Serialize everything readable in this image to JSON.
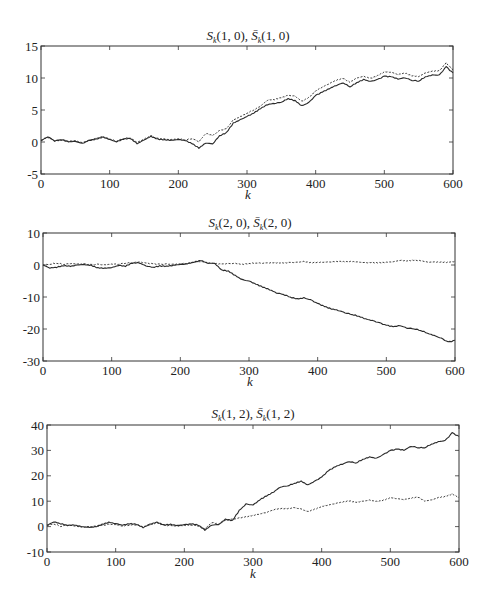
{
  "figure": {
    "panel_count": 3
  },
  "chart_data": [
    {
      "type": "line",
      "title": "S_k(1,0), S̄_k(1,0)",
      "title_parts": {
        "s1": "S",
        "sub1": "k",
        "args1": "(1, 0), ",
        "s2": "S̄",
        "sub2": "k",
        "args2": "(1, 0)"
      },
      "xlabel": "k",
      "ylabel": "",
      "xlim": [
        0,
        600
      ],
      "ylim": [
        -5,
        15
      ],
      "xticks": [
        0,
        100,
        200,
        300,
        400,
        500,
        600
      ],
      "yticks": [
        -5,
        0,
        5,
        10,
        15
      ],
      "grid": false,
      "legend": null,
      "x": [
        0,
        10,
        20,
        30,
        40,
        50,
        60,
        70,
        80,
        90,
        100,
        110,
        120,
        130,
        140,
        150,
        160,
        170,
        180,
        190,
        200,
        210,
        220,
        230,
        240,
        250,
        260,
        270,
        280,
        290,
        300,
        310,
        320,
        330,
        340,
        350,
        360,
        370,
        380,
        390,
        400,
        410,
        420,
        430,
        440,
        450,
        460,
        470,
        480,
        490,
        500,
        510,
        520,
        530,
        540,
        550,
        560,
        570,
        580,
        590,
        600
      ],
      "series": [
        {
          "name": "S_k(1,0)",
          "style": "solid",
          "values": [
            0.2,
            0.8,
            0.1,
            0.3,
            0.0,
            0.1,
            -0.2,
            0.3,
            0.5,
            0.8,
            0.4,
            0.0,
            0.4,
            0.5,
            -0.3,
            0.3,
            0.9,
            0.5,
            0.4,
            0.3,
            0.4,
            0.2,
            -0.3,
            -1.0,
            -0.2,
            -0.3,
            1.0,
            1.5,
            3.0,
            3.5,
            4.0,
            4.5,
            5.2,
            5.8,
            6.0,
            6.2,
            6.8,
            6.5,
            5.7,
            6.2,
            7.3,
            7.8,
            8.3,
            8.8,
            9.2,
            8.6,
            9.3,
            9.8,
            9.5,
            9.8,
            10.3,
            10.2,
            9.8,
            10.0,
            9.6,
            9.5,
            10.2,
            10.5,
            10.5,
            11.8,
            10.8
          ]
        },
        {
          "name": "S̄_k(1,0)",
          "style": "dashed",
          "values": [
            0.3,
            0.7,
            0.2,
            0.3,
            0.1,
            0.2,
            -0.1,
            0.3,
            0.6,
            0.9,
            0.5,
            0.1,
            0.5,
            0.6,
            -0.1,
            0.4,
            1.0,
            0.6,
            0.5,
            0.4,
            0.5,
            0.3,
            0.5,
            0.0,
            1.3,
            1.0,
            1.8,
            2.1,
            3.5,
            4.0,
            4.5,
            5.0,
            5.6,
            6.5,
            6.6,
            6.9,
            7.3,
            7.2,
            6.4,
            7.0,
            8.0,
            8.6,
            9.1,
            9.6,
            9.9,
            9.3,
            10.0,
            10.3,
            10.0,
            10.4,
            11.0,
            10.9,
            10.5,
            10.7,
            10.3,
            10.2,
            10.8,
            11.1,
            11.2,
            12.4,
            11.3
          ]
        }
      ]
    },
    {
      "type": "line",
      "title": "S_k(2,0), S̄_k(2,0)",
      "title_parts": {
        "s1": "S",
        "sub1": "k",
        "args1": "(2, 0), ",
        "s2": "S̄",
        "sub2": "k",
        "args2": "(2, 0)"
      },
      "xlabel": "k",
      "ylabel": "",
      "xlim": [
        0,
        600
      ],
      "ylim": [
        -30,
        10
      ],
      "xticks": [
        0,
        100,
        200,
        300,
        400,
        500,
        600
      ],
      "yticks": [
        -30,
        -20,
        -10,
        0,
        10
      ],
      "grid": false,
      "legend": null,
      "x": [
        0,
        10,
        20,
        30,
        40,
        50,
        60,
        70,
        80,
        90,
        100,
        110,
        120,
        130,
        140,
        150,
        160,
        170,
        180,
        190,
        200,
        210,
        220,
        230,
        240,
        250,
        260,
        270,
        280,
        290,
        300,
        310,
        320,
        330,
        340,
        350,
        360,
        370,
        380,
        390,
        400,
        410,
        420,
        430,
        440,
        450,
        460,
        470,
        480,
        490,
        500,
        510,
        520,
        530,
        540,
        550,
        560,
        570,
        580,
        590,
        600
      ],
      "series": [
        {
          "name": "S_k(2,0)",
          "style": "solid",
          "values": [
            0.0,
            -1.0,
            -0.8,
            -0.3,
            -0.5,
            0.0,
            0.2,
            0.0,
            -0.8,
            -0.9,
            -0.8,
            -0.2,
            -0.5,
            0.5,
            0.6,
            -0.3,
            -0.7,
            -0.2,
            -0.3,
            0.0,
            0.2,
            0.3,
            0.8,
            1.3,
            0.5,
            0.5,
            -1.5,
            -1.8,
            -3.2,
            -4.5,
            -5.0,
            -6.0,
            -7.0,
            -7.8,
            -8.8,
            -9.2,
            -10.0,
            -10.5,
            -10.2,
            -10.8,
            -12.0,
            -13.0,
            -13.8,
            -14.3,
            -15.0,
            -15.5,
            -16.0,
            -16.8,
            -17.3,
            -18.0,
            -18.8,
            -19.3,
            -19.0,
            -19.8,
            -20.0,
            -20.5,
            -21.3,
            -22.0,
            -22.8,
            -24.0,
            -23.5
          ]
        },
        {
          "name": "S̄_k(2,0)",
          "style": "dashed",
          "values": [
            0.0,
            0.2,
            0.5,
            0.1,
            0.4,
            0.3,
            0.4,
            0.2,
            0.3,
            0.1,
            0.3,
            0.2,
            0.5,
            0.6,
            0.9,
            0.6,
            0.4,
            0.3,
            0.4,
            0.3,
            0.4,
            0.5,
            0.8,
            1.0,
            0.5,
            0.4,
            0.3,
            0.5,
            0.6,
            0.3,
            0.5,
            0.6,
            0.5,
            0.6,
            0.6,
            0.6,
            0.8,
            0.9,
            1.2,
            0.8,
            0.9,
            0.9,
            0.9,
            1.0,
            0.9,
            1.0,
            0.9,
            0.8,
            0.9,
            0.8,
            0.9,
            1.0,
            1.4,
            1.2,
            1.4,
            1.3,
            0.9,
            1.0,
            1.0,
            1.0,
            1.2
          ]
        }
      ]
    },
    {
      "type": "line",
      "title": "S_k(1,2), S̄_k(1,2)",
      "title_parts": {
        "s1": "S",
        "sub1": "k",
        "args1": "(1, 2), ",
        "s2": "S̄",
        "sub2": "k",
        "args2": "(1, 2)"
      },
      "xlabel": "k",
      "ylabel": "",
      "xlim": [
        0,
        600
      ],
      "ylim": [
        -10,
        40
      ],
      "xticks": [
        0,
        100,
        200,
        300,
        400,
        500,
        600
      ],
      "yticks": [
        -10,
        0,
        10,
        20,
        30,
        40
      ],
      "grid": false,
      "legend": null,
      "x": [
        0,
        10,
        20,
        30,
        40,
        50,
        60,
        70,
        80,
        90,
        100,
        110,
        120,
        130,
        140,
        150,
        160,
        170,
        180,
        190,
        200,
        210,
        220,
        230,
        240,
        250,
        260,
        270,
        280,
        290,
        300,
        310,
        320,
        330,
        340,
        350,
        360,
        370,
        380,
        390,
        400,
        410,
        420,
        430,
        440,
        450,
        460,
        470,
        480,
        490,
        500,
        510,
        520,
        530,
        540,
        550,
        560,
        570,
        580,
        590,
        600
      ],
      "series": [
        {
          "name": "S_k(1,2)",
          "style": "solid",
          "values": [
            0.5,
            1.8,
            1.0,
            0.3,
            0.5,
            0.0,
            -0.2,
            0.0,
            1.0,
            1.8,
            1.2,
            0.5,
            1.0,
            0.8,
            -0.5,
            1.0,
            1.8,
            0.8,
            1.0,
            0.5,
            0.8,
            1.0,
            0.5,
            -1.5,
            0.5,
            0.8,
            3.0,
            2.5,
            6.5,
            9.0,
            8.5,
            10.5,
            12.0,
            13.5,
            15.5,
            16.0,
            17.0,
            18.0,
            16.5,
            18.0,
            19.5,
            22.0,
            23.5,
            24.5,
            25.5,
            25.0,
            26.5,
            27.5,
            27.0,
            28.5,
            30.0,
            30.5,
            30.0,
            31.5,
            31.0,
            31.0,
            32.5,
            33.5,
            34.0,
            37.0,
            35.5
          ]
        },
        {
          "name": "S̄_k(1,2)",
          "style": "dashed",
          "values": [
            0.5,
            1.0,
            0.0,
            0.5,
            0.2,
            -0.2,
            0.0,
            0.2,
            0.5,
            1.0,
            0.8,
            0.2,
            0.5,
            0.6,
            -0.2,
            0.5,
            1.5,
            0.6,
            0.5,
            0.3,
            0.5,
            0.5,
            0.2,
            -1.0,
            1.5,
            1.0,
            2.5,
            3.0,
            3.5,
            4.0,
            4.5,
            5.0,
            5.5,
            6.5,
            7.0,
            7.0,
            7.5,
            7.0,
            6.0,
            7.0,
            8.0,
            8.5,
            9.0,
            9.5,
            10.0,
            9.5,
            10.0,
            10.5,
            10.0,
            10.5,
            11.5,
            11.0,
            10.5,
            11.0,
            11.5,
            10.0,
            10.5,
            11.5,
            12.0,
            13.0,
            11.5
          ]
        }
      ]
    }
  ],
  "panels": [
    {
      "id": "panel-1",
      "title": {
        "s1": "S",
        "sub1": "k",
        "args1": "(1, 0), ",
        "s2": "S̄",
        "sub2": "k",
        "args2": "(1, 0)"
      },
      "xlabel": "k",
      "xtick_labels": [
        "0",
        "100",
        "200",
        "300",
        "400",
        "500",
        "600"
      ],
      "ytick_labels": [
        "15",
        "10",
        "5",
        "0",
        "-5"
      ]
    },
    {
      "id": "panel-2",
      "title": {
        "s1": "S",
        "sub1": "k",
        "args1": "(2, 0), ",
        "s2": "S̄",
        "sub2": "k",
        "args2": "(2, 0)"
      },
      "xlabel": "k",
      "xtick_labels": [
        "0",
        "100",
        "200",
        "300",
        "400",
        "500",
        "600"
      ],
      "ytick_labels": [
        "10",
        "0",
        "-10",
        "-20",
        "-30"
      ]
    },
    {
      "id": "panel-3",
      "title": {
        "s1": "S",
        "sub1": "k",
        "args1": "(1, 2), ",
        "s2": "S̄",
        "sub2": "k",
        "args2": "(1, 2)"
      },
      "xlabel": "k",
      "xtick_labels": [
        "0",
        "100",
        "200",
        "300",
        "400",
        "500",
        "600"
      ],
      "ytick_labels": [
        "40",
        "30",
        "20",
        "10",
        "0",
        "-10"
      ]
    }
  ],
  "colors": {
    "line": "#2a2a2a",
    "axes": "#333333",
    "background": "#ffffff"
  }
}
